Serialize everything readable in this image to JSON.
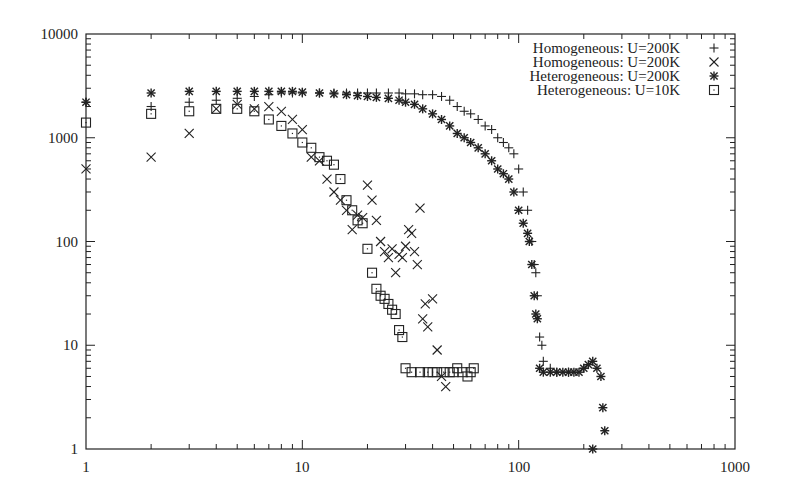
{
  "chart_data": {
    "type": "scatter",
    "title": "",
    "xlabel": "",
    "ylabel": "",
    "xscale": "log",
    "yscale": "log",
    "xlim": [
      1,
      1000
    ],
    "ylim": [
      1,
      10000
    ],
    "grid": false,
    "legend_position": "top-right inside",
    "x_ticks": [
      "1",
      "10",
      "100",
      "1000"
    ],
    "y_ticks": [
      "1",
      "10",
      "100",
      "1000",
      "10000"
    ],
    "series": [
      {
        "name": "Homogeneous: U=200K",
        "marker": "plus",
        "points": [
          [
            1,
            2200
          ],
          [
            2,
            2000
          ],
          [
            3,
            2200
          ],
          [
            4,
            2300
          ],
          [
            5,
            2400
          ],
          [
            6,
            2500
          ],
          [
            7,
            2600
          ],
          [
            8,
            2700
          ],
          [
            9,
            2700
          ],
          [
            10,
            2700
          ],
          [
            12,
            2700
          ],
          [
            14,
            2700
          ],
          [
            16,
            2700
          ],
          [
            18,
            2700
          ],
          [
            20,
            2700
          ],
          [
            22,
            2700
          ],
          [
            25,
            2700
          ],
          [
            28,
            2700
          ],
          [
            30,
            2650
          ],
          [
            33,
            2650
          ],
          [
            36,
            2600
          ],
          [
            40,
            2600
          ],
          [
            44,
            2500
          ],
          [
            48,
            2300
          ],
          [
            52,
            2000
          ],
          [
            56,
            1800
          ],
          [
            60,
            1700
          ],
          [
            65,
            1500
          ],
          [
            70,
            1300
          ],
          [
            75,
            1200
          ],
          [
            80,
            1000
          ],
          [
            85,
            900
          ],
          [
            90,
            800
          ],
          [
            95,
            700
          ],
          [
            100,
            500
          ],
          [
            105,
            300
          ],
          [
            110,
            200
          ],
          [
            115,
            100
          ],
          [
            118,
            60
          ],
          [
            120,
            50
          ],
          [
            122,
            30
          ],
          [
            125,
            12
          ],
          [
            128,
            10
          ],
          [
            130,
            7
          ],
          [
            140,
            6
          ],
          [
            150,
            5.5
          ],
          [
            170,
            5.5
          ],
          [
            200,
            6
          ]
        ]
      },
      {
        "name": "Homogeneous: U=200K",
        "marker": "cross",
        "points": [
          [
            1,
            500
          ],
          [
            2,
            650
          ],
          [
            3,
            1100
          ],
          [
            4,
            1900
          ],
          [
            5,
            2100
          ],
          [
            6,
            1900
          ],
          [
            7,
            2000
          ],
          [
            8,
            1800
          ],
          [
            9,
            1500
          ],
          [
            10,
            1200
          ],
          [
            11,
            650
          ],
          [
            12,
            600
          ],
          [
            13,
            400
          ],
          [
            14,
            300
          ],
          [
            15,
            250
          ],
          [
            16,
            200
          ],
          [
            17,
            130
          ],
          [
            18,
            180
          ],
          [
            19,
            170
          ],
          [
            20,
            350
          ],
          [
            21,
            250
          ],
          [
            22,
            160
          ],
          [
            23,
            100
          ],
          [
            24,
            80
          ],
          [
            25,
            70
          ],
          [
            26,
            85
          ],
          [
            27,
            50
          ],
          [
            28,
            75
          ],
          [
            29,
            70
          ],
          [
            30,
            90
          ],
          [
            31,
            130
          ],
          [
            32,
            120
          ],
          [
            33,
            80
          ],
          [
            34,
            60
          ],
          [
            35,
            210
          ],
          [
            36,
            18
          ],
          [
            37,
            25
          ],
          [
            38,
            15
          ],
          [
            40,
            28
          ],
          [
            42,
            9
          ],
          [
            44,
            5
          ],
          [
            46,
            4
          ]
        ]
      },
      {
        "name": "Heterogeneous: U=200K",
        "marker": "star",
        "points": [
          [
            1,
            2200
          ],
          [
            2,
            2700
          ],
          [
            3,
            2800
          ],
          [
            4,
            2800
          ],
          [
            5,
            2800
          ],
          [
            6,
            2800
          ],
          [
            7,
            2800
          ],
          [
            8,
            2800
          ],
          [
            9,
            2800
          ],
          [
            10,
            2750
          ],
          [
            12,
            2700
          ],
          [
            14,
            2650
          ],
          [
            16,
            2600
          ],
          [
            18,
            2550
          ],
          [
            20,
            2500
          ],
          [
            22,
            2450
          ],
          [
            25,
            2400
          ],
          [
            28,
            2300
          ],
          [
            30,
            2200
          ],
          [
            33,
            2100
          ],
          [
            36,
            1900
          ],
          [
            40,
            1700
          ],
          [
            44,
            1500
          ],
          [
            48,
            1300
          ],
          [
            52,
            1100
          ],
          [
            56,
            1000
          ],
          [
            60,
            900
          ],
          [
            65,
            800
          ],
          [
            70,
            700
          ],
          [
            75,
            600
          ],
          [
            80,
            500
          ],
          [
            85,
            450
          ],
          [
            90,
            400
          ],
          [
            95,
            300
          ],
          [
            100,
            200
          ],
          [
            105,
            150
          ],
          [
            110,
            120
          ],
          [
            112,
            100
          ],
          [
            115,
            60
          ],
          [
            118,
            30
          ],
          [
            120,
            20
          ],
          [
            122,
            18
          ],
          [
            125,
            6
          ],
          [
            130,
            5.5
          ],
          [
            140,
            5.5
          ],
          [
            150,
            5.5
          ],
          [
            160,
            5.5
          ],
          [
            170,
            5.5
          ],
          [
            180,
            5.5
          ],
          [
            190,
            5.5
          ],
          [
            200,
            6
          ],
          [
            210,
            6.5
          ],
          [
            220,
            7
          ],
          [
            230,
            6
          ],
          [
            240,
            5
          ],
          [
            245,
            2.5
          ],
          [
            250,
            1.5
          ],
          [
            220,
            1
          ]
        ]
      },
      {
        "name": "Heterogeneous: U=10K",
        "marker": "square",
        "points": [
          [
            1,
            1400
          ],
          [
            2,
            1700
          ],
          [
            3,
            1800
          ],
          [
            4,
            1900
          ],
          [
            5,
            1900
          ],
          [
            6,
            1800
          ],
          [
            7,
            1500
          ],
          [
            8,
            1300
          ],
          [
            9,
            1100
          ],
          [
            10,
            900
          ],
          [
            11,
            800
          ],
          [
            12,
            650
          ],
          [
            13,
            600
          ],
          [
            14,
            550
          ],
          [
            15,
            400
          ],
          [
            16,
            250
          ],
          [
            17,
            200
          ],
          [
            18,
            160
          ],
          [
            19,
            150
          ],
          [
            20,
            85
          ],
          [
            21,
            50
          ],
          [
            22,
            35
          ],
          [
            23,
            30
          ],
          [
            24,
            28
          ],
          [
            25,
            25
          ],
          [
            26,
            22
          ],
          [
            27,
            20
          ],
          [
            28,
            14
          ],
          [
            29,
            12
          ],
          [
            30,
            6
          ],
          [
            32,
            5.5
          ],
          [
            35,
            5.5
          ],
          [
            38,
            5.5
          ],
          [
            40,
            5.5
          ],
          [
            42,
            5.5
          ],
          [
            45,
            5.5
          ],
          [
            48,
            5.5
          ],
          [
            50,
            5.5
          ],
          [
            52,
            6
          ],
          [
            55,
            5.5
          ],
          [
            58,
            5
          ],
          [
            60,
            5.5
          ],
          [
            62,
            6
          ]
        ]
      }
    ]
  },
  "axes": {
    "x_tick_labels": [
      "1",
      "10",
      "100",
      "1000"
    ],
    "y_tick_labels": [
      "1",
      "10",
      "100",
      "1000",
      "10000"
    ]
  },
  "legend": {
    "items": [
      {
        "label": "Homogeneous: U=200K",
        "marker": "plus"
      },
      {
        "label": "Homogeneous: U=200K",
        "marker": "cross"
      },
      {
        "label": "Heterogeneous: U=200K",
        "marker": "star"
      },
      {
        "label": "Heterogeneous: U=10K",
        "marker": "square"
      }
    ]
  },
  "colors": {
    "ink": "#222222",
    "background": "#ffffff"
  }
}
